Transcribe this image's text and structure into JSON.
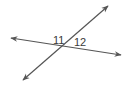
{
  "diagram": {
    "colors": {
      "line": "#555555",
      "label": "#3a3a3a",
      "background": "#ffffff"
    },
    "lines": [
      {
        "name": "line-a",
        "from": [
          11,
          38
        ],
        "to": [
          121,
          55
        ],
        "arrows": "both"
      },
      {
        "name": "line-b",
        "from": [
          23,
          80
        ],
        "to": [
          108,
          6
        ],
        "arrows": "both"
      }
    ],
    "intersection": [
      62,
      46
    ],
    "angle_labels": [
      {
        "id": "angle-11",
        "text": "11",
        "x": 53,
        "y": 44
      },
      {
        "id": "angle-12",
        "text": "12",
        "x": 74,
        "y": 46
      }
    ]
  }
}
